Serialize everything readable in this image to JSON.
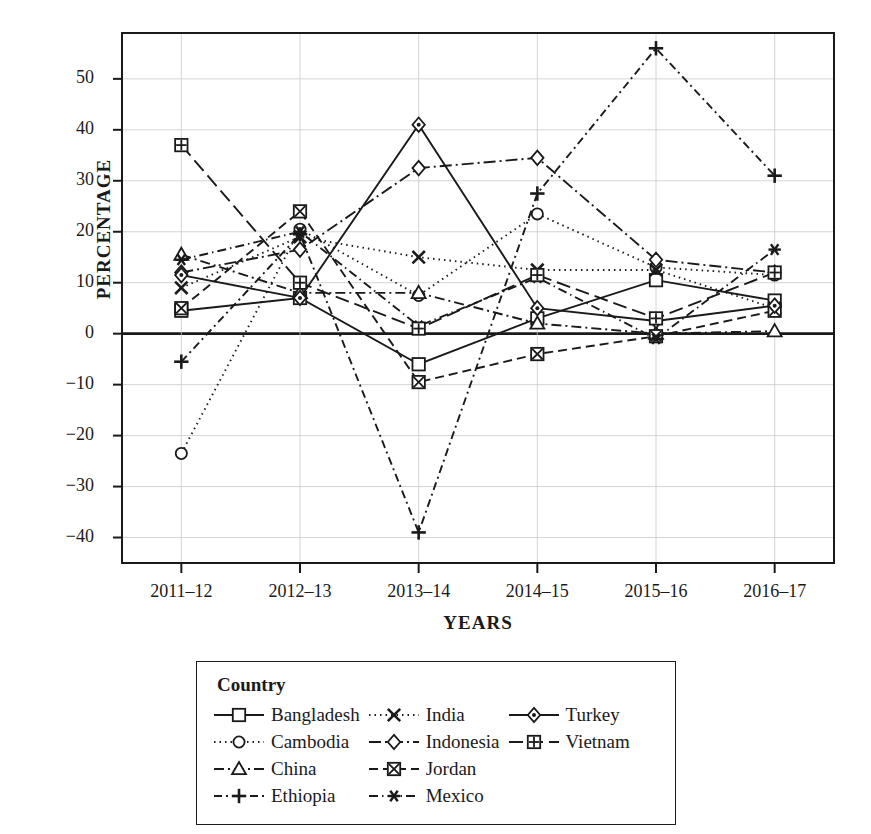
{
  "chart_data": {
    "type": "line",
    "title": "",
    "xlabel": "YEARS",
    "ylabel": "PERCENTAGE",
    "categories": [
      "2011–12",
      "2012–13",
      "2013–14",
      "2014–15",
      "2015–16",
      "2016–17"
    ],
    "yticks": [
      -40,
      -30,
      -20,
      -10,
      0,
      10,
      20,
      30,
      40,
      50
    ],
    "yticklabels": [
      "−40",
      "−30",
      "−20",
      "−10",
      "0",
      "10",
      "20",
      "30",
      "40",
      "50"
    ],
    "ylim": [
      -45,
      59
    ],
    "grid": true,
    "legend_position": "below",
    "legend_title": "Country",
    "series": [
      {
        "name": "Bangladesh",
        "marker": "square",
        "dash": "solid",
        "values": [
          4.5,
          7.0,
          -6.0,
          3.0,
          10.5,
          6.5
        ]
      },
      {
        "name": "Cambodia",
        "marker": "circle",
        "dash": "dotted",
        "values": [
          -23.5,
          20.5,
          7.5,
          23.5,
          13.0,
          11.5
        ]
      },
      {
        "name": "China",
        "marker": "triangle",
        "dash": "dashdot",
        "values": [
          15.5,
          8.0,
          8.0,
          2.0,
          0.0,
          0.5
        ]
      },
      {
        "name": "Ethiopia",
        "marker": "plus",
        "dash": "dashdot2",
        "values": [
          -5.5,
          19.5,
          -39.0,
          27.5,
          56.0,
          31.0
        ]
      },
      {
        "name": "India",
        "marker": "cross",
        "dash": "dotted2",
        "values": [
          9.0,
          19.0,
          15.0,
          12.5,
          12.5,
          5.0
        ]
      },
      {
        "name": "Indonesia",
        "marker": "diamond",
        "dash": "dashdot3",
        "values": [
          12.0,
          16.5,
          32.5,
          34.5,
          14.5,
          12.0
        ]
      },
      {
        "name": "Jordan",
        "marker": "boxx",
        "dash": "dashed",
        "values": [
          5.0,
          24.0,
          -9.5,
          -4.0,
          -0.5,
          4.5
        ]
      },
      {
        "name": "Mexico",
        "marker": "star",
        "dash": "dashdot4",
        "values": [
          14.5,
          20.0,
          1.5,
          11.0,
          -1.0,
          16.5
        ]
      },
      {
        "name": "Turkey",
        "marker": "diamond2",
        "dash": "solid2",
        "values": [
          11.5,
          7.0,
          41.0,
          5.0,
          2.5,
          5.5
        ]
      },
      {
        "name": "Vietnam",
        "marker": "boxplus",
        "dash": "longdash",
        "values": [
          37.0,
          10.0,
          1.0,
          11.5,
          3.0,
          12.0
        ]
      }
    ]
  },
  "legend": {
    "title": "Country",
    "columns": [
      [
        "Bangladesh",
        "Cambodia",
        "China",
        "Ethiopia"
      ],
      [
        "India",
        "Indonesia",
        "Jordan",
        "Mexico"
      ],
      [
        "Turkey",
        "Vietnam"
      ]
    ]
  },
  "axes": {
    "ylabel": "PERCENTAGE",
    "xlabel": "YEARS"
  }
}
